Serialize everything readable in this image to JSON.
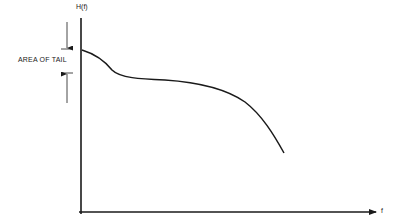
{
  "diagram": {
    "type": "spectrum-plot",
    "y_axis_label": "H(f)",
    "x_axis_label": "f",
    "annotation": "AREA OF TAIL",
    "stroke_color": "#1a1a1a",
    "background": "#ffffff"
  },
  "curve": {
    "description": "Decreasing curve starting at top of y-axis, small dip to a plateau, then falling off toward the right",
    "points": [
      [
        82,
        50
      ],
      [
        95,
        56
      ],
      [
        108,
        66
      ],
      [
        118,
        74
      ],
      [
        135,
        78
      ],
      [
        160,
        80
      ],
      [
        190,
        82
      ],
      [
        215,
        87
      ],
      [
        240,
        98
      ],
      [
        260,
        116
      ],
      [
        275,
        137
      ],
      [
        284,
        153
      ]
    ]
  }
}
